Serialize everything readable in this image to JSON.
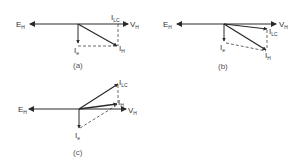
{
  "colors": {
    "stroke": "#2a2a2a",
    "dashed": "#444444",
    "text": "#333333"
  },
  "diagrams": [
    {
      "caption": "(a)",
      "labels": {
        "E": "E",
        "E_sub": "H",
        "V": "V",
        "V_sub": "H",
        "ILC": "I",
        "ILC_sub": "LC",
        "IH": "I",
        "IH_sub": "H",
        "Ie": "I",
        "Ie_sub": "e"
      }
    },
    {
      "caption": "(b)",
      "labels": {
        "E": "E",
        "E_sub": "H",
        "V": "V",
        "V_sub": "H",
        "ILC": "I",
        "ILC_sub": "LC",
        "IH": "I",
        "IH_sub": "H",
        "Ie": "I",
        "Ie_sub": "e"
      }
    },
    {
      "caption": "(c)",
      "labels": {
        "E": "E",
        "E_sub": "H",
        "V": "V",
        "V_sub": "H",
        "ILC": "I",
        "ILC_sub": "LC",
        "IH": "I",
        "IH_sub": "H",
        "Ie": "I",
        "Ie_sub": "e"
      }
    }
  ]
}
